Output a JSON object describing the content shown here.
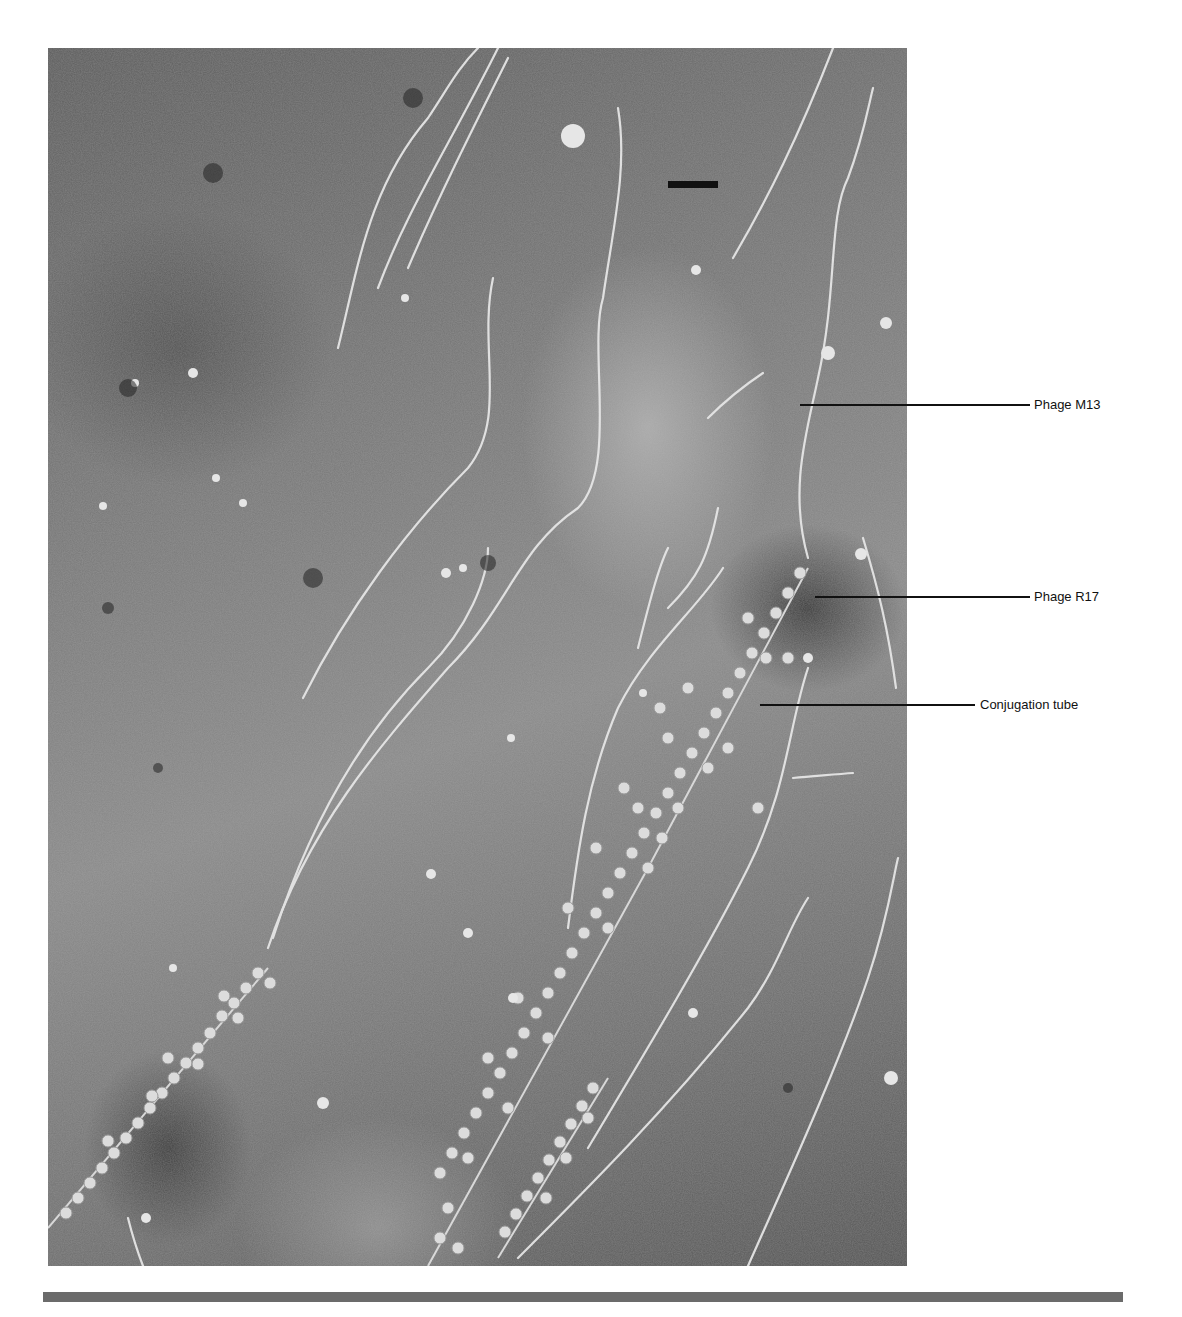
{
  "figure": {
    "scale_bar": true,
    "labels": [
      {
        "id": "m13",
        "text": "Phage M13"
      },
      {
        "id": "r17",
        "text": "Phage R17"
      },
      {
        "id": "conjugation_tube",
        "text": "Conjugation tube"
      }
    ]
  },
  "colors": {
    "background": "#ffffff",
    "rule": "#6b6b6b",
    "leader_lines": "#111111"
  }
}
